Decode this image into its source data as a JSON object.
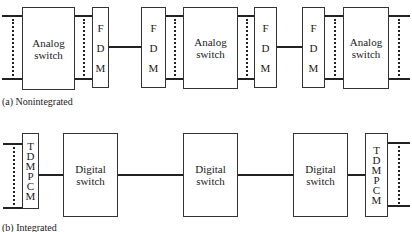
{
  "diagram": {
    "nonintegrated": {
      "caption": "(a) Nonintegrated",
      "switches": [
        {
          "line1": "Analog",
          "line2": "switch"
        },
        {
          "line1": "Analog",
          "line2": "switch"
        },
        {
          "line1": "Analog",
          "line2": "switch"
        }
      ],
      "muxes": [
        {
          "letters": [
            "F",
            "D",
            "M"
          ]
        },
        {
          "letters": [
            "F",
            "D",
            "M"
          ]
        },
        {
          "letters": [
            "F",
            "D",
            "M"
          ]
        },
        {
          "letters": [
            "F",
            "D",
            "M"
          ]
        }
      ]
    },
    "integrated": {
      "caption": "(b) Integrated",
      "switches": [
        {
          "line1": "Digital",
          "line2": "switch"
        },
        {
          "line1": "Digital",
          "line2": "switch"
        },
        {
          "line1": "Digital",
          "line2": "switch"
        }
      ],
      "muxes": [
        {
          "letters": [
            "T",
            "D",
            "M",
            "P",
            "C",
            "M"
          ]
        },
        {
          "letters": [
            "T",
            "D",
            "M",
            "P",
            "C",
            "M"
          ]
        }
      ]
    }
  }
}
